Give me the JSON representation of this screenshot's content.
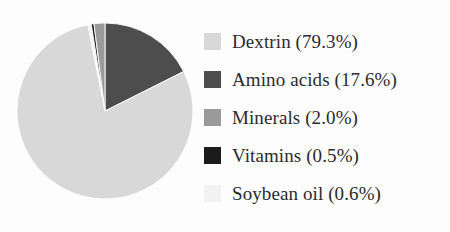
{
  "chart_data": {
    "type": "pie",
    "title": "",
    "subtitle": "",
    "xlabel": "",
    "ylabel": "",
    "grid": false,
    "legend_position": "right",
    "unit": "%",
    "start_angle_deg": 0,
    "direction": "clockwise",
    "categories": [
      "Dextrin",
      "Amino acids",
      "Minerals",
      "Vitamins",
      "Soybean oil"
    ],
    "values": [
      79.3,
      17.6,
      2.0,
      0.5,
      0.6
    ],
    "colors": [
      "#d8d8d8",
      "#4d4d4d",
      "#9a9a9a",
      "#1c1c1c",
      "#f2f2f2"
    ],
    "slices": [
      {
        "label": "Dextrin",
        "value": 79.3,
        "color": "#d8d8d8",
        "legend_text": "Dextrin (79.3%)",
        "swatch_name": "swatch-dextrin"
      },
      {
        "label": "Amino acids",
        "value": 17.6,
        "color": "#4d4d4d",
        "legend_text": "Amino acids (17.6%)",
        "swatch_name": "swatch-amino-acids"
      },
      {
        "label": "Minerals",
        "value": 2.0,
        "color": "#9a9a9a",
        "legend_text": "Minerals (2.0%)",
        "swatch_name": "swatch-minerals"
      },
      {
        "label": "Vitamins",
        "value": 0.5,
        "color": "#1c1c1c",
        "legend_text": "Vitamins (0.5%)",
        "swatch_name": "swatch-vitamins"
      },
      {
        "label": "Soybean oil",
        "value": 0.6,
        "color": "#f2f2f2",
        "legend_text": "Soybean oil (0.6%)",
        "swatch_name": "swatch-soybean-oil"
      }
    ]
  },
  "legend": {
    "items": [
      {
        "label": "Dextrin (79.3%)",
        "color": "#d8d8d8"
      },
      {
        "label": "Amino acids (17.6%)",
        "color": "#4d4d4d"
      },
      {
        "label": "Minerals (2.0%)",
        "color": "#9a9a9a"
      },
      {
        "label": "Vitamins (0.5%)",
        "color": "#1c1c1c"
      },
      {
        "label": "Soybean oil (0.6%)",
        "color": "#f2f2f2"
      }
    ]
  }
}
